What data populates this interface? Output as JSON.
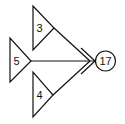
{
  "diagram": {
    "type": "tree-merge",
    "stroke_color": "#111111",
    "background": "#ffffff",
    "triangles": [
      {
        "id": "t3",
        "label": "3",
        "position": "top"
      },
      {
        "id": "t5",
        "label": "5",
        "position": "middle"
      },
      {
        "id": "t4",
        "label": "4",
        "position": "bottom"
      }
    ],
    "result_node": {
      "label": "17"
    },
    "edges": [
      {
        "from": "t3",
        "to": "result"
      },
      {
        "from": "t5",
        "to": "result"
      },
      {
        "from": "t4",
        "to": "result"
      }
    ]
  }
}
